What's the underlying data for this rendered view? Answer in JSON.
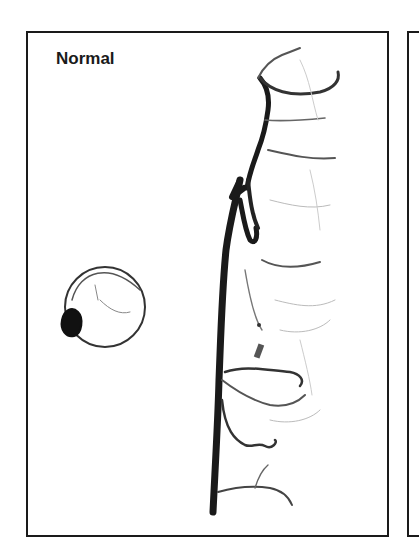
{
  "figure": {
    "panel_label": "Normal",
    "colors": {
      "border": "#1a1a1a",
      "vessel": "#1a1a1a",
      "background": "#ffffff"
    }
  }
}
